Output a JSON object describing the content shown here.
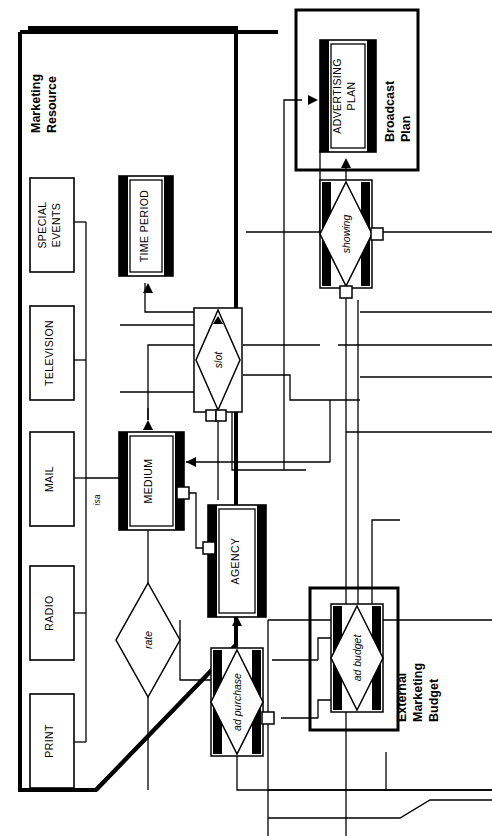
{
  "diagram": {
    "kind": "entity-relationship-diagram",
    "orientation": "rotated-90-counterclockwise",
    "background_color": "#ffffff",
    "line_color": "#000000",
    "fill_color": "#ffffff",
    "groups": [
      {
        "id": "marketing-resource",
        "label": "Marketing\nResource",
        "label_line1": "Marketing",
        "label_line2": "Resource"
      },
      {
        "id": "broadcast-plan",
        "label": "Broadcast\nPlan",
        "label_line1": "Broadcast",
        "label_line2": "Plan"
      },
      {
        "id": "external-marketing-budget",
        "label": "External\nMarketing\nBudget",
        "label_line1": "External",
        "label_line2": "Marketing",
        "label_line3": "Budget"
      }
    ],
    "entities": [
      {
        "id": "special-events",
        "label": "SPECIAL EVENTS",
        "label_line1": "SPECIAL",
        "label_line2": "EVENTS",
        "style": "weak-subtype",
        "shadow": "none"
      },
      {
        "id": "television",
        "label": "TELEVISION",
        "label_line1": "TELEVISION",
        "label_line2": "",
        "style": "weak-subtype",
        "shadow": "none"
      },
      {
        "id": "mail",
        "label": "MAIL",
        "label_line1": "MAIL",
        "label_line2": "",
        "style": "weak-subtype",
        "shadow": "none"
      },
      {
        "id": "radio",
        "label": "RADIO",
        "label_line1": "RADIO",
        "label_line2": "",
        "style": "weak-subtype",
        "shadow": "none"
      },
      {
        "id": "print",
        "label": "PRINT",
        "label_line1": "PRINT",
        "label_line2": "",
        "style": "weak-subtype",
        "shadow": "none"
      },
      {
        "id": "time-period",
        "label": "TIME PERIOD",
        "label_line1": "TIME PERIOD",
        "label_line2": "",
        "style": "strong-shadowed",
        "shadow": "double-bar"
      },
      {
        "id": "medium",
        "label": "MEDIUM",
        "label_line1": "MEDIUM",
        "label_line2": "",
        "style": "strong-shadowed",
        "shadow": "double-bar"
      },
      {
        "id": "agency",
        "label": "AGENCY",
        "label_line1": "AGENCY",
        "label_line2": "",
        "style": "strong-shadowed",
        "shadow": "double-bar"
      },
      {
        "id": "advertising-plan",
        "label": "ADVERTISING PLAN",
        "label_line1": "ADVERTISING",
        "label_line2": "PLAN",
        "style": "strong-shadowed",
        "shadow": "double-bar"
      }
    ],
    "relationships": [
      {
        "id": "rate",
        "label": "rate",
        "style": "plain-diamond"
      },
      {
        "id": "slot",
        "label": "slot",
        "style": "boxed-diamond"
      },
      {
        "id": "showing",
        "label": "showing",
        "style": "boxed-diamond-shadowed"
      },
      {
        "id": "ad-purchase",
        "label": "ad purchase",
        "style": "boxed-diamond-shadowed"
      },
      {
        "id": "ad-budget",
        "label": "ad budget",
        "style": "boxed-diamond-shadowed"
      }
    ],
    "edge_labels": [
      {
        "id": "isa",
        "label": "isa",
        "between": [
          "subtypes",
          "medium"
        ]
      }
    ]
  }
}
